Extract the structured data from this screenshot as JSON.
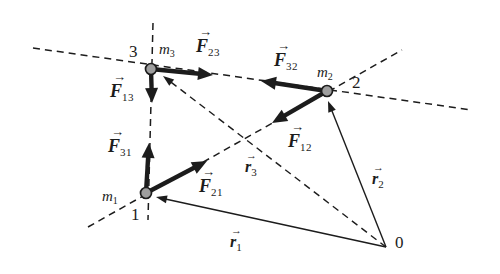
{
  "colors": {
    "background": "#ffffff",
    "ink": "#1c1c1c",
    "mass_fill": "#9e9e9e"
  },
  "canvas": {
    "width": 500,
    "height": 274
  },
  "vector_arrow_glyph": "→",
  "masses": [
    {
      "id": "m3",
      "x": 151,
      "y": 69,
      "r": 5.5,
      "mass_label": {
        "main": "m",
        "sub": "3",
        "x": 159,
        "y": 42
      },
      "number_label": {
        "text": "3",
        "x": 129,
        "y": 43
      }
    },
    {
      "id": "m2",
      "x": 327,
      "y": 91,
      "r": 5.5,
      "mass_label": {
        "main": "m",
        "sub": "2",
        "x": 317,
        "y": 65
      },
      "number_label": {
        "text": "2",
        "x": 352,
        "y": 74
      }
    },
    {
      "id": "m1",
      "x": 146,
      "y": 193,
      "r": 5.5,
      "mass_label": {
        "main": "m",
        "sub": "1",
        "x": 102,
        "y": 189
      },
      "number_label": {
        "text": "1",
        "x": 131,
        "y": 206
      }
    }
  ],
  "origin": {
    "x": 386,
    "y": 247,
    "label": {
      "text": "0",
      "x": 395,
      "y": 234
    }
  },
  "construction_lines": [
    {
      "name": "line-through-3-2",
      "x1": 33,
      "y1": 48,
      "x2": 472,
      "y2": 110
    },
    {
      "name": "line-through-1-3",
      "x1": 153,
      "y1": 23,
      "x2": 148,
      "y2": 220
    },
    {
      "name": "line-through-1-2",
      "x1": 88,
      "y1": 227,
      "x2": 402,
      "y2": 50
    }
  ],
  "forces": [
    {
      "name": "F23",
      "main": "F",
      "sub": "23",
      "x1": 151,
      "y1": 69,
      "x2": 213,
      "y2": 75,
      "label": {
        "x": 196,
        "y": 28
      }
    },
    {
      "name": "F32",
      "main": "F",
      "sub": "32",
      "x1": 327,
      "y1": 91,
      "x2": 261,
      "y2": 81,
      "label": {
        "x": 274,
        "y": 42
      }
    },
    {
      "name": "F13",
      "main": "F",
      "sub": "13",
      "x1": 151,
      "y1": 69,
      "x2": 152,
      "y2": 103,
      "label": {
        "x": 110,
        "y": 73
      }
    },
    {
      "name": "F31",
      "main": "F",
      "sub": "31",
      "x1": 146,
      "y1": 193,
      "x2": 149,
      "y2": 143,
      "label": {
        "x": 108,
        "y": 128
      }
    },
    {
      "name": "F21",
      "main": "F",
      "sub": "21",
      "x1": 146,
      "y1": 193,
      "x2": 207,
      "y2": 161,
      "label": {
        "x": 199,
        "y": 168
      }
    },
    {
      "name": "F12",
      "main": "F",
      "sub": "12",
      "x1": 327,
      "y1": 91,
      "x2": 272,
      "y2": 123,
      "label": {
        "x": 288,
        "y": 123
      }
    }
  ],
  "position_vectors": [
    {
      "name": "r1",
      "main": "r",
      "sub": "1",
      "x1": 386,
      "y1": 247,
      "x2": 156,
      "y2": 197,
      "dashed": false,
      "label": {
        "x": 230,
        "y": 226
      }
    },
    {
      "name": "r2",
      "main": "r",
      "sub": "2",
      "x1": 386,
      "y1": 247,
      "x2": 328,
      "y2": 101,
      "dashed": false,
      "label": {
        "x": 372,
        "y": 163
      }
    },
    {
      "name": "r3",
      "main": "r",
      "sub": "3",
      "x1": 386,
      "y1": 247,
      "x2": 163,
      "y2": 76,
      "dashed": true,
      "label": {
        "x": 245,
        "y": 151
      }
    }
  ]
}
